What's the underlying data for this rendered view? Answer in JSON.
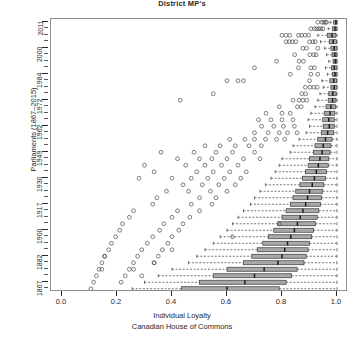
{
  "chart_data": {
    "type": "boxplot",
    "title": "District MP's",
    "xlabel_lines": [
      "Individual Loyalty",
      "Canadian House of Commons"
    ],
    "ylabel": "Parliaments (1867–2015)",
    "xlim": [
      -0.04,
      1.04
    ],
    "xticks": [
      0.0,
      0.2,
      0.4,
      0.6,
      0.8,
      1.0
    ],
    "xticklabels": [
      "0.0",
      "0.2",
      "0.4",
      "0.6",
      "0.8",
      "1.0"
    ],
    "yticklabels": [
      "1867",
      "1882",
      "1900",
      "1917",
      "1930",
      "1949",
      "1962",
      "1972",
      "1984",
      "2000",
      "2011"
    ],
    "ytick_rows": [
      1,
      5,
      9,
      13,
      17,
      21,
      25,
      29,
      33,
      37,
      41
    ],
    "n_rows": 42,
    "grid": false,
    "legend": null,
    "orientation": "horizontal",
    "box_fill": "#a8a8a8",
    "box_edge": "#3a3a3a",
    "median_color": "#1a1a1a",
    "whisker_style": "dashed",
    "outlier_marker": "open-circle",
    "rows": [
      {
        "parliament": "2011",
        "row": 41,
        "q1": 0.988,
        "median": 0.996,
        "q3": 1.0,
        "lo": 0.975,
        "hi": 1.0,
        "outliers": [
          0.93,
          0.945,
          0.952,
          0.958,
          0.962
        ]
      },
      {
        "parliament": "2008",
        "row": 40,
        "q1": 0.984,
        "median": 0.993,
        "q3": 1.0,
        "lo": 0.968,
        "hi": 1.0,
        "outliers": [
          0.905,
          0.918,
          0.926,
          0.934,
          0.941,
          0.949
        ]
      },
      {
        "parliament": "2006",
        "row": 39,
        "q1": 0.965,
        "median": 0.982,
        "q3": 0.996,
        "lo": 0.93,
        "hi": 1.0,
        "outliers": [
          0.8,
          0.815,
          0.828,
          0.86,
          0.872,
          0.884,
          0.897
        ]
      },
      {
        "parliament": "2004",
        "row": 38,
        "q1": 0.972,
        "median": 0.986,
        "q3": 0.998,
        "lo": 0.94,
        "hi": 1.0,
        "outliers": [
          0.815,
          0.826,
          0.838,
          0.85,
          0.9,
          0.912,
          0.921
        ]
      },
      {
        "parliament": "2000",
        "row": 37,
        "q1": 0.978,
        "median": 0.99,
        "q3": 1.0,
        "lo": 0.955,
        "hi": 1.0,
        "outliers": [
          0.876,
          0.889,
          0.93
        ]
      },
      {
        "parliament": "1997",
        "row": 36,
        "q1": 0.982,
        "median": 0.992,
        "q3": 1.0,
        "lo": 0.962,
        "hi": 1.0,
        "outliers": [
          0.846,
          0.901,
          0.915,
          0.924
        ]
      },
      {
        "parliament": "1993",
        "row": 35,
        "q1": 0.986,
        "median": 0.994,
        "q3": 1.0,
        "lo": 0.97,
        "hi": 1.0,
        "outliers": [
          0.78,
          0.862,
          0.878
        ]
      },
      {
        "parliament": "1988",
        "row": 34,
        "q1": 0.98,
        "median": 0.99,
        "q3": 1.0,
        "lo": 0.958,
        "hi": 1.0,
        "outliers": [
          0.7,
          0.86,
          0.905,
          0.918
        ]
      },
      {
        "parliament": "1984",
        "row": 33,
        "q1": 0.984,
        "median": 0.993,
        "q3": 1.0,
        "lo": 0.965,
        "hi": 1.0,
        "outliers": [
          0.83,
          0.905,
          0.93
        ]
      },
      {
        "parliament": "1980",
        "row": 32,
        "q1": 0.974,
        "median": 0.988,
        "q3": 0.999,
        "lo": 0.945,
        "hi": 1.0,
        "outliers": [
          0.6,
          0.64,
          0.66,
          0.9
        ]
      },
      {
        "parliament": "1979",
        "row": 31,
        "q1": 0.978,
        "median": 0.99,
        "q3": 1.0,
        "lo": 0.95,
        "hi": 1.0,
        "outliers": [
          0.885,
          0.902,
          0.916,
          0.928
        ]
      },
      {
        "parliament": "1974",
        "row": 30,
        "q1": 0.97,
        "median": 0.985,
        "q3": 0.997,
        "lo": 0.938,
        "hi": 1.0,
        "outliers": [
          0.55,
          0.872,
          0.886
        ]
      },
      {
        "parliament": "1972",
        "row": 29,
        "q1": 0.968,
        "median": 0.984,
        "q3": 0.996,
        "lo": 0.93,
        "hi": 1.0,
        "outliers": [
          0.43,
          0.84,
          0.862,
          0.876,
          0.89
        ]
      },
      {
        "parliament": "1968",
        "row": 28,
        "q1": 0.96,
        "median": 0.978,
        "q3": 0.994,
        "lo": 0.92,
        "hi": 1.0,
        "outliers": [
          0.79,
          0.856,
          0.87
        ]
      },
      {
        "parliament": "1965",
        "row": 27,
        "q1": 0.955,
        "median": 0.975,
        "q3": 0.992,
        "lo": 0.905,
        "hi": 1.0,
        "outliers": [
          0.742,
          0.8,
          0.83
        ]
      },
      {
        "parliament": "1963",
        "row": 26,
        "q1": 0.948,
        "median": 0.97,
        "q3": 0.99,
        "lo": 0.895,
        "hi": 1.0,
        "outliers": [
          0.715,
          0.76,
          0.8,
          0.84
        ]
      },
      {
        "parliament": "1962",
        "row": 25,
        "q1": 0.95,
        "median": 0.972,
        "q3": 0.99,
        "lo": 0.9,
        "hi": 1.0,
        "outliers": [
          0.726,
          0.77,
          0.805,
          0.845
        ]
      },
      {
        "parliament": "1958",
        "row": 24,
        "q1": 0.944,
        "median": 0.966,
        "q3": 0.988,
        "lo": 0.888,
        "hi": 1.0,
        "outliers": [
          0.7,
          0.75,
          0.79,
          0.82,
          0.855
        ]
      },
      {
        "parliament": "1957",
        "row": 23,
        "q1": 0.93,
        "median": 0.958,
        "q3": 0.982,
        "lo": 0.862,
        "hi": 1.0,
        "outliers": [
          0.61,
          0.665,
          0.7,
          0.74,
          0.78,
          0.81
        ]
      },
      {
        "parliament": "1953",
        "row": 22,
        "q1": 0.92,
        "median": 0.95,
        "q3": 0.978,
        "lo": 0.84,
        "hi": 1.0,
        "outliers": [
          0.52,
          0.575,
          0.63,
          0.68,
          0.725
        ]
      },
      {
        "parliament": "1949",
        "row": 21,
        "q1": 0.915,
        "median": 0.946,
        "q3": 0.975,
        "lo": 0.83,
        "hi": 1.0,
        "outliers": [
          0.36,
          0.48,
          0.56,
          0.62,
          0.7
        ]
      },
      {
        "parliament": "1945",
        "row": 20,
        "q1": 0.9,
        "median": 0.938,
        "q3": 0.97,
        "lo": 0.8,
        "hi": 1.0,
        "outliers": [
          0.42,
          0.5,
          0.545,
          0.6,
          0.66,
          0.72
        ]
      },
      {
        "parliament": "1940",
        "row": 19,
        "q1": 0.895,
        "median": 0.932,
        "q3": 0.968,
        "lo": 0.79,
        "hi": 1.0,
        "outliers": [
          0.3,
          0.45,
          0.52,
          0.58,
          0.64
        ]
      },
      {
        "parliament": "1935",
        "row": 18,
        "q1": 0.885,
        "median": 0.925,
        "q3": 0.962,
        "lo": 0.775,
        "hi": 1.0,
        "outliers": [
          0.335,
          0.49,
          0.55,
          0.61,
          0.67
        ]
      },
      {
        "parliament": "1930",
        "row": 17,
        "q1": 0.875,
        "median": 0.918,
        "q3": 0.958,
        "lo": 0.76,
        "hi": 1.0,
        "outliers": [
          0.28,
          0.4,
          0.47,
          0.53,
          0.59,
          0.65
        ]
      },
      {
        "parliament": "1926",
        "row": 16,
        "q1": 0.865,
        "median": 0.91,
        "q3": 0.952,
        "lo": 0.74,
        "hi": 1.0,
        "outliers": [
          0.44,
          0.51,
          0.57,
          0.63
        ]
      },
      {
        "parliament": "1925",
        "row": 15,
        "q1": 0.85,
        "median": 0.9,
        "q3": 0.948,
        "lo": 0.72,
        "hi": 1.0,
        "outliers": [
          0.38,
          0.46,
          0.54,
          0.6
        ]
      },
      {
        "parliament": "1921",
        "row": 14,
        "q1": 0.84,
        "median": 0.893,
        "q3": 0.944,
        "lo": 0.7,
        "hi": 1.0,
        "outliers": [
          0.345,
          0.5,
          0.56
        ]
      },
      {
        "parliament": "1917",
        "row": 13,
        "q1": 0.83,
        "median": 0.886,
        "q3": 0.94,
        "lo": 0.685,
        "hi": 1.0,
        "outliers": [
          0.33,
          0.47,
          0.545
        ]
      },
      {
        "parliament": "1911",
        "row": 12,
        "q1": 0.815,
        "median": 0.876,
        "q3": 0.934,
        "lo": 0.66,
        "hi": 1.0,
        "outliers": [
          0.26,
          0.42,
          0.5
        ]
      },
      {
        "parliament": "1908",
        "row": 11,
        "q1": 0.8,
        "median": 0.866,
        "q3": 0.928,
        "lo": 0.64,
        "hi": 1.0,
        "outliers": [
          0.245,
          0.4,
          0.465
        ]
      },
      {
        "parliament": "1904",
        "row": 10,
        "q1": 0.785,
        "median": 0.856,
        "q3": 0.922,
        "lo": 0.62,
        "hi": 1.0,
        "outliers": [
          0.22,
          0.37,
          0.44
        ]
      },
      {
        "parliament": "1900",
        "row": 9,
        "q1": 0.77,
        "median": 0.845,
        "q3": 0.915,
        "lo": 0.6,
        "hi": 1.0,
        "outliers": [
          0.21,
          0.355,
          0.425
        ]
      },
      {
        "parliament": "1896",
        "row": 8,
        "q1": 0.75,
        "median": 0.832,
        "q3": 0.908,
        "lo": 0.575,
        "hi": 1.0,
        "outliers": [
          0.195,
          0.33,
          0.4
        ]
      },
      {
        "parliament": "1891",
        "row": 7,
        "q1": 0.73,
        "median": 0.82,
        "q3": 0.9,
        "lo": 0.55,
        "hi": 1.0,
        "outliers": [
          0.18,
          0.31,
          0.385
        ]
      },
      {
        "parliament": "1887",
        "row": 6,
        "q1": 0.71,
        "median": 0.81,
        "q3": 0.895,
        "lo": 0.52,
        "hi": 1.0,
        "outliers": [
          0.17,
          0.29,
          0.365
        ]
      },
      {
        "parliament": "1882",
        "row": 5,
        "q1": 0.69,
        "median": 0.8,
        "q3": 0.888,
        "lo": 0.49,
        "hi": 1.0,
        "outliers": [
          0.155,
          0.275,
          0.35
        ]
      },
      {
        "parliament": "1878",
        "row": 4,
        "q1": 0.66,
        "median": 0.785,
        "q3": 0.88,
        "lo": 0.46,
        "hi": 1.0,
        "outliers": [
          0.145,
          0.26,
          0.335
        ]
      },
      {
        "parliament": "1874",
        "row": 3,
        "q1": 0.6,
        "median": 0.735,
        "q3": 0.855,
        "lo": 0.4,
        "hi": 1.0,
        "outliers": [
          0.135,
          0.245
        ]
      },
      {
        "parliament": "1872",
        "row": 2,
        "q1": 0.55,
        "median": 0.7,
        "q3": 0.835,
        "lo": 0.35,
        "hi": 1.0,
        "outliers": [
          0.125,
          0.23
        ]
      },
      {
        "parliament": "1867b",
        "row": 1,
        "q1": 0.5,
        "median": 0.665,
        "q3": 0.815,
        "lo": 0.3,
        "hi": 1.0,
        "outliers": [
          0.115,
          0.215
        ]
      },
      {
        "parliament": "1867",
        "row": 0,
        "q1": 0.435,
        "median": 0.6,
        "q3": 0.79,
        "lo": 0.255,
        "hi": 1.0,
        "outliers": [
          0.105
        ]
      }
    ],
    "scatter_outliers": [
      {
        "x": 0.155,
        "row": 5
      },
      {
        "x": 0.335,
        "row": 4
      },
      {
        "x": 0.4,
        "row": 6
      },
      {
        "x": 0.145,
        "row": 3
      },
      {
        "x": 0.26,
        "row": 3
      },
      {
        "x": 0.29,
        "row": 2
      },
      {
        "x": 0.62,
        "row": 8
      },
      {
        "x": 0.79,
        "row": 10
      }
    ]
  }
}
